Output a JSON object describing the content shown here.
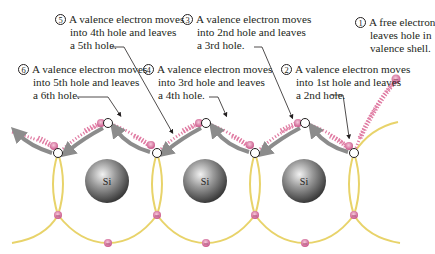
{
  "diagram": {
    "type": "hole current in silicon crystal lattice",
    "atom_label": "Si",
    "atoms": [
      {
        "label": "Si"
      },
      {
        "label": "Si"
      },
      {
        "label": "Si"
      }
    ],
    "annotations": [
      {
        "number": "1",
        "lines": [
          "A free electron",
          "leaves hole in",
          "valence shell."
        ]
      },
      {
        "number": "2",
        "lines": [
          "A valence electron moves",
          "into 1st hole and leaves",
          "a 2nd hole."
        ]
      },
      {
        "number": "3",
        "lines": [
          "A valence electron moves",
          "into 2nd hole and leaves",
          "a 3rd hole."
        ]
      },
      {
        "number": "4",
        "lines": [
          "A valence electron moves",
          "into 3rd hole and leaves",
          "a 4th hole."
        ]
      },
      {
        "number": "5",
        "lines": [
          "A valence electron moves",
          "into 4th hole and leaves",
          "a 5th hole."
        ]
      },
      {
        "number": "6",
        "lines": [
          "A valence electron moves",
          "into 5th hole and leaves",
          "a 6th hole."
        ]
      }
    ],
    "electron_symbol": "−",
    "colors": {
      "bond": "#e8d36a",
      "electron": "#d9709a",
      "electron_trail": "#e07ca3",
      "arrow": "#8c8c8c",
      "atom": "#6e6e6e",
      "text": "#231f20"
    }
  }
}
